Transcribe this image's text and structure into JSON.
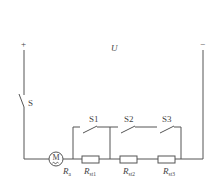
{
  "diagram": {
    "type": "circuit",
    "terminals": {
      "positive": "+",
      "negative": "−"
    },
    "voltage_label": "U",
    "main_switch": "S",
    "bypass_switches": [
      "S1",
      "S2",
      "S3"
    ],
    "motor": {
      "symbol": "M",
      "resistance_label": {
        "main": "R",
        "sub": "a"
      }
    },
    "resistors": [
      {
        "main": "R",
        "sub": "st1"
      },
      {
        "main": "R",
        "sub": "st2"
      },
      {
        "main": "R",
        "sub": "st3"
      }
    ],
    "colors": {
      "wire": "#555555",
      "text": "#444444",
      "background": "#ffffff"
    }
  }
}
